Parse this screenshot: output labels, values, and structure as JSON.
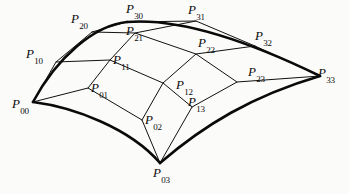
{
  "figure": {
    "background_color": "#fbfbfa",
    "line_color": "#111111",
    "boundary_color": "#0a0a0a",
    "width": 349,
    "height": 194
  },
  "control_points": [
    {
      "id": "P00",
      "base": "P",
      "sub": "00",
      "x": 33,
      "y": 102,
      "label_x": 12,
      "label_y": 97,
      "corner": true
    },
    {
      "id": "P10",
      "base": "P",
      "sub": "10",
      "x": 56,
      "y": 62,
      "label_x": 26,
      "label_y": 47,
      "corner": false
    },
    {
      "id": "P20",
      "base": "P",
      "sub": "20",
      "x": 92,
      "y": 32,
      "label_x": 71,
      "label_y": 12,
      "corner": false
    },
    {
      "id": "P30",
      "base": "P",
      "sub": "30",
      "x": 127,
      "y": 22,
      "label_x": 126,
      "label_y": 2,
      "corner": true
    },
    {
      "id": "P01",
      "base": "P",
      "sub": "01",
      "x": 88,
      "y": 88,
      "label_x": 91,
      "label_y": 81,
      "corner": false
    },
    {
      "id": "P11",
      "base": "P",
      "sub": "11",
      "x": 110,
      "y": 60,
      "label_x": 113,
      "label_y": 53,
      "corner": false
    },
    {
      "id": "P21",
      "base": "P",
      "sub": "21",
      "x": 135,
      "y": 33,
      "label_x": 126,
      "label_y": 24,
      "corner": false
    },
    {
      "id": "P31",
      "base": "P",
      "sub": "31",
      "x": 196,
      "y": 21,
      "label_x": 188,
      "label_y": 3,
      "corner": true
    },
    {
      "id": "P02",
      "base": "P",
      "sub": "02",
      "x": 142,
      "y": 120,
      "label_x": 145,
      "label_y": 113,
      "corner": false
    },
    {
      "id": "P12",
      "base": "P",
      "sub": "12",
      "x": 163,
      "y": 83,
      "label_x": 176,
      "label_y": 78,
      "corner": false
    },
    {
      "id": "P22",
      "base": "P",
      "sub": "22",
      "x": 196,
      "y": 54,
      "label_x": 198,
      "label_y": 36,
      "corner": false
    },
    {
      "id": "P32",
      "base": "P",
      "sub": "32",
      "x": 255,
      "y": 46,
      "label_x": 255,
      "label_y": 29,
      "corner": false
    },
    {
      "id": "P03",
      "base": "P",
      "sub": "03",
      "x": 160,
      "y": 163,
      "label_x": 153,
      "label_y": 166,
      "corner": true
    },
    {
      "id": "P13",
      "base": "P",
      "sub": "13",
      "x": 192,
      "y": 107,
      "label_x": 188,
      "label_y": 95,
      "corner": false
    },
    {
      "id": "P23",
      "base": "P",
      "sub": "23",
      "x": 237,
      "y": 82,
      "label_x": 248,
      "label_y": 65,
      "corner": false
    },
    {
      "id": "P33",
      "base": "P",
      "sub": "33",
      "x": 320,
      "y": 76,
      "label_x": 318,
      "label_y": 66,
      "corner": true
    }
  ],
  "net_rows": [
    {
      "name": "row-i0",
      "path": "M 33 102 L 88 88 L 142 120 L 160 163"
    },
    {
      "name": "row-i1",
      "path": "M 56 62 L 110 60 L 163 83 L 192 107"
    },
    {
      "name": "row-i2",
      "path": "M 92 32 L 135 33 L 196 54 L 237 82"
    },
    {
      "name": "row-i3",
      "path": "M 127 22 L 196 21 L 255 46 L 320 76"
    }
  ],
  "net_cols": [
    {
      "name": "col-j0",
      "path": "M 33 102 L 56 62 L 92 32 L 127 22"
    },
    {
      "name": "col-j1",
      "path": "M 88 88 L 110 60 L 135 33 L 196 21"
    },
    {
      "name": "col-j2",
      "path": "M 142 120 L 163 83 L 196 54 L 255 46"
    },
    {
      "name": "col-j3",
      "path": "M 160 163 L 192 107 L 237 82 L 320 76"
    }
  ],
  "boundary_curves": [
    {
      "name": "boundary-top",
      "path": "M 33 102 C 56 54 92 24 127 22 C 127 22 127 22 127 22"
    },
    {
      "name": "boundary-u0",
      "path": "M 33 102 C 57 57 95 25 127 22"
    },
    {
      "name": "boundary-v3",
      "path": "M 127 22 C 175 18 240 37 320 76"
    },
    {
      "name": "boundary-v0",
      "path": "M 33 102 C 73 107 130 128 160 163"
    },
    {
      "name": "boundary-u3",
      "path": "M 160 163 C 204 125 252 96 320 76"
    }
  ],
  "icons": {
    "surface": "bezier-surface-icon"
  }
}
